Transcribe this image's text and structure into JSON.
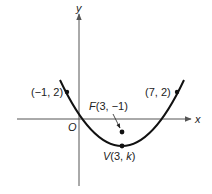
{
  "diagram": {
    "axes": {
      "x_label": "x",
      "y_label": "y",
      "origin_label": "O"
    },
    "points": [
      {
        "id": "left-point",
        "label": "(−1, 2)",
        "x": -1,
        "y": 2
      },
      {
        "id": "right-point",
        "label": "(7, 2)",
        "x": 7,
        "y": 2
      },
      {
        "id": "focus",
        "label_prefix": "F",
        "label": "F(3, −1)",
        "coords": "(3, −1)",
        "x": 3,
        "y": -1
      },
      {
        "id": "vertex",
        "label_prefix": "V",
        "label": "V(3, k)",
        "coords_pre": "(3, ",
        "coords_var": "k",
        "coords_post": ")",
        "x": 3,
        "y": "k"
      }
    ],
    "curve": {
      "type": "parabola",
      "opens": "up",
      "axis_of_symmetry": "x = 3"
    },
    "colors": {
      "axis": "#555555",
      "curve": "#111111",
      "text": "#222222",
      "background": "#ffffff"
    }
  }
}
